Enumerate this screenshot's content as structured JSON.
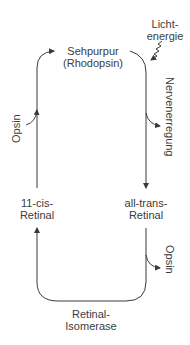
{
  "diagram": {
    "type": "cycle",
    "title": "",
    "nodes": {
      "sehpurpur": {
        "line1": "Sehpurpur",
        "line2": "(Rhodopsin)"
      },
      "all_trans": {
        "line1": "all-trans-",
        "line2": "Retinal"
      },
      "cis": {
        "line1": "11-cis-",
        "line2": "Retinal"
      },
      "isomerase": {
        "line1": "Retinal-",
        "line2": "Isomerase"
      }
    },
    "annotations": {
      "light": {
        "line1": "Licht-",
        "line2": "energie"
      },
      "nerve": "Nervenerregung",
      "opsin_in": "Opsin",
      "opsin_out": "Opsin"
    },
    "edges": [
      {
        "from": "Sehpurpur (Rhodopsin)",
        "to": "all-trans-Retinal",
        "input": "Lichtenergie",
        "output": "Nervenerregung"
      },
      {
        "from": "all-trans-Retinal",
        "to": "11-cis-Retinal",
        "output": "Opsin",
        "via": "Retinal-Isomerase"
      },
      {
        "from": "11-cis-Retinal",
        "to": "Sehpurpur (Rhodopsin)",
        "input": "Opsin"
      }
    ],
    "colors": {
      "line": "#3a3a3a",
      "text": "#3c3c3c",
      "background": "#ffffff"
    }
  }
}
